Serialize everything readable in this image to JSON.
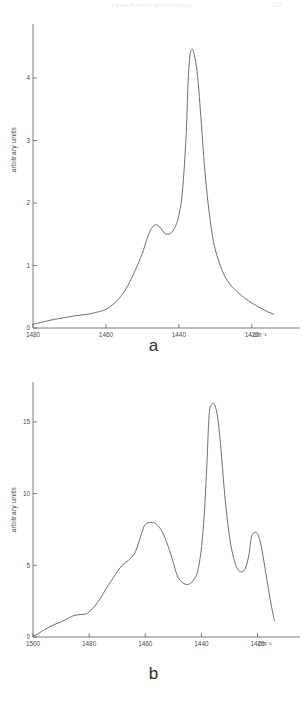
{
  "header": {
    "title": "Laser Raman spectroscopy",
    "page": "135"
  },
  "figure_a": {
    "panel_label": "a",
    "ylabel": "arbitrary units",
    "xunit": "cm⁻¹"
  },
  "figure_b": {
    "panel_label": "b",
    "ylabel": "arbitrary units",
    "xunit": "cm⁻¹"
  },
  "chart_data": [
    {
      "type": "line",
      "id": "a",
      "title": "a",
      "xlabel": "cm⁻¹",
      "ylabel": "arbitrary units",
      "xlim": [
        1480,
        1412
      ],
      "ylim": [
        0,
        4.8
      ],
      "xticks": [
        1480,
        1460,
        1440,
        1420
      ],
      "xticklabels": [
        "1480",
        "1460",
        "1440",
        "1420"
      ],
      "yticks": [
        0,
        1,
        2,
        3,
        4
      ],
      "yticklabels": [
        "0",
        "1",
        "2",
        "3",
        "4"
      ],
      "grid": false,
      "legend": null,
      "x": [
        1480,
        1477,
        1474,
        1471,
        1468,
        1465,
        1462,
        1460,
        1458,
        1456,
        1454,
        1452,
        1450,
        1449,
        1448,
        1447,
        1446,
        1445,
        1444,
        1443,
        1442,
        1441,
        1440,
        1439,
        1438,
        1437.5,
        1437,
        1436.5,
        1436,
        1435,
        1434,
        1433,
        1432,
        1431,
        1430,
        1428,
        1426,
        1424,
        1422,
        1420,
        1418,
        1416,
        1414
      ],
      "y": [
        0.06,
        0.1,
        0.14,
        0.17,
        0.2,
        0.22,
        0.26,
        0.3,
        0.38,
        0.5,
        0.68,
        0.92,
        1.2,
        1.38,
        1.54,
        1.63,
        1.65,
        1.6,
        1.52,
        1.5,
        1.53,
        1.62,
        1.8,
        2.2,
        3.1,
        3.9,
        4.35,
        4.45,
        4.42,
        4.1,
        3.4,
        2.6,
        2.0,
        1.55,
        1.25,
        0.9,
        0.7,
        0.58,
        0.48,
        0.4,
        0.33,
        0.27,
        0.22
      ],
      "peaks": [
        {
          "x": 1446,
          "y": 1.65,
          "kind": "shoulder"
        },
        {
          "x": 1436.5,
          "y": 4.45,
          "kind": "main"
        }
      ],
      "minima": [
        {
          "x": 1443,
          "y": 1.5
        }
      ]
    },
    {
      "type": "line",
      "id": "b",
      "title": "b",
      "xlabel": "cm⁻¹",
      "ylabel": "arbitrary units",
      "xlim": [
        1500,
        1412
      ],
      "ylim": [
        0,
        17.5
      ],
      "xticks": [
        1500,
        1480,
        1460,
        1440,
        1420
      ],
      "xticklabels": [
        "1500",
        "1480",
        "1460",
        "1440",
        "1420"
      ],
      "yticks": [
        0,
        5,
        10,
        15
      ],
      "yticklabels": [
        "0",
        "5",
        "10",
        "15"
      ],
      "grid": false,
      "legend": null,
      "x": [
        1500,
        1498,
        1496,
        1494,
        1492,
        1490,
        1488,
        1486,
        1484,
        1482,
        1481,
        1480,
        1478,
        1476,
        1474,
        1472,
        1470,
        1468,
        1466,
        1464,
        1463,
        1462,
        1461,
        1460,
        1458,
        1456,
        1454,
        1452,
        1450,
        1449,
        1448,
        1446,
        1444,
        1442,
        1441,
        1440,
        1439,
        1438,
        1437.5,
        1437,
        1436,
        1435,
        1434,
        1433,
        1432,
        1431,
        1430,
        1429,
        1428,
        1427,
        1426,
        1425,
        1424,
        1423,
        1422.5,
        1422,
        1421,
        1420,
        1419,
        1418,
        1417,
        1416,
        1415,
        1414
      ],
      "y": [
        0.05,
        0.25,
        0.5,
        0.72,
        0.9,
        1.05,
        1.25,
        1.45,
        1.55,
        1.58,
        1.62,
        1.75,
        2.15,
        2.7,
        3.35,
        3.95,
        4.55,
        5.05,
        5.35,
        5.75,
        6.2,
        6.8,
        7.4,
        7.85,
        8.0,
        7.85,
        7.35,
        6.4,
        5.2,
        4.5,
        4.05,
        3.7,
        3.72,
        4.2,
        4.9,
        6.2,
        8.5,
        12.2,
        14.6,
        15.9,
        16.3,
        16.05,
        15.0,
        13.0,
        10.6,
        8.6,
        7.0,
        5.9,
        5.15,
        4.7,
        4.55,
        4.6,
        4.95,
        5.8,
        6.6,
        7.1,
        7.3,
        7.2,
        6.6,
        5.6,
        4.4,
        3.2,
        2.1,
        1.15
      ],
      "peaks": [
        {
          "x": 1481,
          "y": 1.62,
          "kind": "shoulder"
        },
        {
          "x": 1458,
          "y": 8.0,
          "kind": "medium"
        },
        {
          "x": 1436,
          "y": 16.3,
          "kind": "main"
        },
        {
          "x": 1422,
          "y": 7.3,
          "kind": "medium"
        }
      ],
      "minima": [
        {
          "x": 1446,
          "y": 3.7
        },
        {
          "x": 1426,
          "y": 4.55
        }
      ]
    }
  ]
}
